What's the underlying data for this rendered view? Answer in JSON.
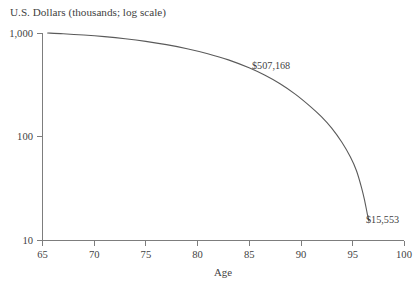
{
  "chart_data": {
    "type": "line",
    "title": "U.S. Dollars (thousands; log scale)",
    "xlabel": "Age",
    "ylabel": "U.S. Dollars (thousands; log scale)",
    "xlim": [
      65,
      100
    ],
    "ylim": [
      10,
      1000
    ],
    "yscale": "log",
    "grid": false,
    "legend": "none",
    "xticks": [
      65,
      70,
      75,
      80,
      85,
      90,
      95,
      100
    ],
    "xtick_labels": [
      "65",
      "70",
      "75",
      "80",
      "85",
      "90",
      "95",
      "100"
    ],
    "yticks": [
      10,
      100,
      1000
    ],
    "ytick_labels": [
      "10",
      "100",
      "1,000"
    ],
    "series": [
      {
        "name": "Projected portfolio balance",
        "x": [
          65.5,
          67,
          69,
          71,
          73,
          75,
          77,
          79,
          81,
          83,
          85,
          86.5,
          88,
          89.5,
          91,
          92,
          93,
          94,
          94.8,
          95.4,
          95.9,
          96.2,
          96.45,
          96.6
        ],
        "values": [
          1000,
          985,
          957,
          922,
          880,
          830,
          772,
          706,
          632,
          551,
          462,
          393,
          324,
          256,
          193,
          156,
          121,
          88,
          64,
          47,
          32,
          24,
          18,
          15.553
        ]
      }
    ],
    "annotations": [
      {
        "label": "$507,168",
        "x": 86.5,
        "value": 507.168,
        "px": 252,
        "py": 66
      },
      {
        "label": "$15,553",
        "x": 96.6,
        "value": 15.553,
        "px": 366,
        "py": 220
      }
    ]
  }
}
